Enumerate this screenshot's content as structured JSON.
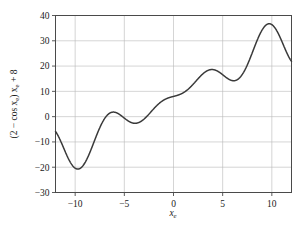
{
  "chart_data": {
    "type": "line",
    "title": "",
    "subtitle": "",
    "xlabel": "x_e",
    "ylabel": "(2 - cos x_e) x_e + 8",
    "xlim": [
      -12,
      12
    ],
    "ylim": [
      -30,
      40
    ],
    "grid": true,
    "legend": null,
    "xticks": [
      -10,
      -5,
      0,
      5,
      10
    ],
    "xtick_labels": [
      "-10",
      "-5",
      "0",
      "5",
      "10"
    ],
    "yticks": [
      -30,
      -20,
      -10,
      0,
      10,
      20,
      30,
      40
    ],
    "ytick_labels": [
      "-30",
      "-20",
      "-10",
      "0",
      "10",
      "20",
      "30",
      "40"
    ],
    "series": [
      {
        "name": "(2 - cos x_e) x_e + 8",
        "color": "#3a3a3a",
        "linewidth": 1.5,
        "formula": "(2 - cos(x)) * x + 8",
        "x": [
          -12.0,
          -11.5,
          -11.0,
          -10.5,
          -10.0,
          -9.5,
          -9.0,
          -8.5,
          -8.0,
          -7.5,
          -7.0,
          -6.5,
          -6.0,
          -5.5,
          -5.0,
          -4.5,
          -4.0,
          -3.5,
          -3.0,
          -2.5,
          -2.0,
          -1.5,
          -1.0,
          -0.5,
          0.0,
          0.5,
          1.0,
          1.5,
          2.0,
          2.5,
          3.0,
          3.5,
          4.0,
          4.5,
          5.0,
          5.5,
          6.0,
          6.5,
          7.0,
          7.5,
          8.0,
          8.5,
          9.0,
          9.5,
          10.0,
          10.5,
          11.0,
          11.5,
          12.0
        ],
        "y": [
          -4.1,
          -10.8,
          -16.9,
          -19.9,
          -19.8,
          -18.0,
          -16.2,
          -15.4,
          -15.3,
          -14.9,
          -13.3,
          -10.9,
          -9.0,
          -8.4,
          -9.0,
          -9.9,
          -10.0,
          -9.0,
          -7.2,
          -5.5,
          -4.2,
          -3.1,
          -1.5,
          0.6,
          3.0,
          5.3,
          7.4,
          9.4,
          11.6,
          14.3,
          17.3,
          20.1,
          22.0,
          22.7,
          22.6,
          22.6,
          23.8,
          26.6,
          30.9,
          36.0,
          40.8,
          44.3,
          45.7,
          44.9,
          42.4,
          39.0,
          35.6,
          33.2,
          32.1
        ]
      }
    ],
    "annotations": [],
    "key_points": {
      "left_edge": {
        "x": -12,
        "y": -4.1
      },
      "global_min": {
        "x": -9.8,
        "y": -20.5
      },
      "local_max_1": {
        "x": -6.1,
        "y": 2.0
      },
      "local_min_1": {
        "x": -3.7,
        "y": -2.6
      },
      "local_max_2": {
        "x": 3.8,
        "y": 19.5
      },
      "local_min_2": {
        "x": 6.0,
        "y": 15.1
      },
      "global_max": {
        "x": 9.5,
        "y": 37.8
      },
      "right_edge": {
        "x": 12,
        "y": 21.3
      }
    },
    "colors": {
      "line": "#3a3a3a",
      "grid": "#b9b9b9",
      "frame": "#4a4a4a",
      "text": "#1a1a1a",
      "background": "#ffffff"
    }
  },
  "axes": {
    "y_label_parts": {
      "open": "(2 − cos ",
      "var1": "x",
      "sub1": "e",
      "close": ") ",
      "var2": "x",
      "sub2": "e",
      "tail": " + 8"
    },
    "x_label_parts": {
      "var": "x",
      "sub": "e"
    }
  }
}
